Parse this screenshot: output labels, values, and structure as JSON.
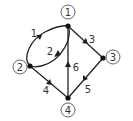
{
  "graph": {
    "type": "directed",
    "nodes": [
      {
        "id": "1",
        "label": "1"
      },
      {
        "id": "2",
        "label": "2"
      },
      {
        "id": "3",
        "label": "3"
      },
      {
        "id": "4",
        "label": "4"
      }
    ],
    "edges": [
      {
        "id": "e1",
        "label": "1",
        "from": "2",
        "to": "1"
      },
      {
        "id": "e2",
        "label": "2",
        "from": "1",
        "to": "2"
      },
      {
        "id": "e3",
        "label": "3",
        "from": "1",
        "to": "3"
      },
      {
        "id": "e4",
        "label": "4",
        "from": "2",
        "to": "4"
      },
      {
        "id": "e5",
        "label": "5",
        "from": "3",
        "to": "4"
      },
      {
        "id": "e6",
        "label": "6",
        "from": "4",
        "to": "1"
      }
    ]
  },
  "colors": {
    "edge": "#222222",
    "node": "#111111",
    "label": "#333333",
    "background": "#ffffff"
  }
}
